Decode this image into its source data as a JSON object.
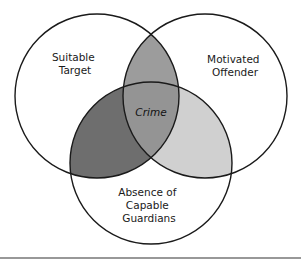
{
  "diagram": {
    "type": "venn",
    "sets": [
      {
        "id": "target",
        "label_lines": [
          "Suitable",
          "Target"
        ]
      },
      {
        "id": "offender",
        "label_lines": [
          "Motivated",
          "Offender"
        ]
      },
      {
        "id": "guardians",
        "label_lines": [
          "Absence of",
          "Capable",
          "Guardians"
        ]
      }
    ],
    "intersection_label": "Crime",
    "colors": {
      "outline": "#1a1a1a",
      "background": "#ffffff",
      "target_offender": "#9c9c9c",
      "target_guardians": "#6e6e6e",
      "offender_guardians": "#d0d0d0",
      "all_three": "#949494",
      "rule": "#333333"
    }
  }
}
